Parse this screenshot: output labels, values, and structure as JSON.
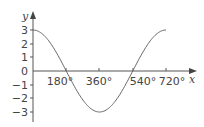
{
  "chart_data": {
    "type": "line",
    "title": "",
    "xlabel": "x",
    "ylabel": "y",
    "function": "y = 3cos(x/2)",
    "x_ticks": [
      180,
      360,
      540,
      720
    ],
    "x_tick_labels": [
      "180°",
      "360°",
      "540°",
      "720°"
    ],
    "y_ticks": [
      3,
      2,
      1,
      0,
      -1,
      -2,
      -3
    ],
    "y_tick_labels": [
      "3",
      "2",
      "1",
      "0",
      "−1",
      "−2",
      "−3"
    ],
    "xlim": [
      0,
      720
    ],
    "ylim": [
      -3,
      3
    ],
    "grid": false,
    "legend": null,
    "series": [
      {
        "name": "curve",
        "x": [
          0,
          90,
          180,
          270,
          360,
          450,
          540,
          630,
          720
        ],
        "y": [
          3,
          2.12,
          0,
          -2.12,
          -3,
          -2.12,
          0,
          2.12,
          3
        ]
      }
    ],
    "colors": {
      "axis": "#555555",
      "curve": "#666666",
      "text": "#444444"
    }
  }
}
